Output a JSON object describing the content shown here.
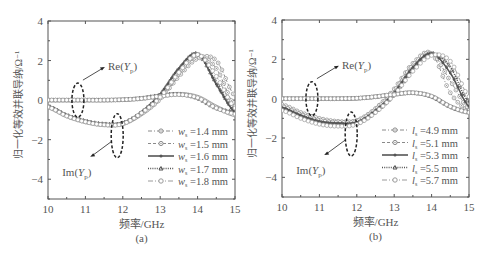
{
  "chart_data": [
    {
      "type": "line",
      "panel_label": "(a)",
      "xlabel": "频率/GHz",
      "ylabel": "归一化等效并联导纳/Ω⁻¹",
      "xlim": [
        10,
        15
      ],
      "ylim": [
        -5,
        4
      ],
      "xticks": [
        10,
        11,
        12,
        13,
        14,
        15
      ],
      "yticks": [
        4,
        2,
        0,
        -2,
        -4
      ],
      "grid": false,
      "legend_position": "lower right",
      "annotations": [
        "Re(Yp)",
        "Im(Yp)"
      ],
      "x": [
        10,
        10.5,
        11,
        11.5,
        12,
        12.5,
        13,
        13.5,
        14,
        14.5,
        15
      ],
      "series": [
        {
          "name": "ws=1.4 mm",
          "style": "dash-dot circle-dot",
          "re": [
            0.0,
            0.0,
            0.0,
            0.0,
            0.02,
            0.08,
            0.2,
            0.3,
            0.15,
            -0.35,
            -0.75
          ],
          "im": [
            -0.35,
            -0.8,
            -1.1,
            -1.25,
            -1.2,
            -0.7,
            0.1,
            1.3,
            2.2,
            1.6,
            -0.3
          ]
        },
        {
          "name": "ws=1.5 mm",
          "style": "dashed circle-dot",
          "re": [
            0.0,
            0.0,
            0.0,
            0.0,
            0.02,
            0.08,
            0.2,
            0.3,
            0.15,
            -0.35,
            -0.75
          ],
          "im": [
            -0.35,
            -0.8,
            -1.1,
            -1.25,
            -1.2,
            -0.7,
            0.05,
            1.2,
            2.1,
            2.0,
            0.2
          ]
        },
        {
          "name": "ws=1.6 mm",
          "style": "solid filled-dot",
          "re": [
            0.0,
            0.0,
            0.0,
            0.0,
            0.02,
            0.1,
            0.25,
            0.3,
            0.1,
            -0.4,
            -0.6
          ],
          "im": [
            -0.3,
            -0.75,
            -1.05,
            -1.2,
            -1.15,
            -0.6,
            0.3,
            1.6,
            2.35,
            0.8,
            -0.6
          ]
        },
        {
          "name": "ws=1.7 mm",
          "style": "dotted triangle",
          "re": [
            0.0,
            0.0,
            0.0,
            0.0,
            0.02,
            0.1,
            0.25,
            0.3,
            0.1,
            -0.4,
            -0.6
          ],
          "im": [
            -0.3,
            -0.75,
            -1.05,
            -1.2,
            -1.15,
            -0.6,
            0.3,
            1.6,
            2.35,
            0.9,
            -0.5
          ]
        },
        {
          "name": "ws=1.8 mm",
          "style": "dash-dot open-circle",
          "re": [
            0.0,
            0.0,
            0.0,
            0.0,
            0.02,
            0.08,
            0.2,
            0.28,
            0.12,
            -0.4,
            -0.7
          ],
          "im": [
            -0.35,
            -0.8,
            -1.1,
            -1.25,
            -1.2,
            -0.65,
            0.15,
            1.4,
            2.3,
            1.2,
            -0.4
          ]
        }
      ]
    },
    {
      "type": "line",
      "panel_label": "(b)",
      "xlabel": "频率/GHz",
      "ylabel": "归一化等效并联导纳/Ω⁻¹",
      "xlim": [
        10,
        15
      ],
      "ylim": [
        -5,
        4
      ],
      "xticks": [
        10,
        11,
        12,
        13,
        14,
        15
      ],
      "yticks": [
        4,
        2,
        0,
        -2,
        -4
      ],
      "grid": false,
      "legend_position": "lower right",
      "annotations": [
        "Re(Yp)",
        "Im(Yp)"
      ],
      "x": [
        10,
        10.5,
        11,
        11.5,
        12,
        12.5,
        13,
        13.5,
        14,
        14.5,
        15
      ],
      "series": [
        {
          "name": "ls=4.9 mm",
          "style": "dash-dot circle-dot",
          "re": [
            0.0,
            0.0,
            0.0,
            0.0,
            0.02,
            0.1,
            0.22,
            0.3,
            0.12,
            -0.4,
            -0.7
          ],
          "im": [
            -0.3,
            -0.7,
            -1.0,
            -1.15,
            -1.1,
            -0.5,
            0.5,
            1.8,
            2.3,
            0.3,
            -0.6
          ]
        },
        {
          "name": "ls=5.1 mm",
          "style": "dashed circle-dot",
          "re": [
            0.0,
            0.0,
            0.0,
            0.0,
            0.02,
            0.1,
            0.22,
            0.3,
            0.12,
            -0.4,
            -0.7
          ],
          "im": [
            -0.4,
            -0.8,
            -1.1,
            -1.2,
            -1.15,
            -0.55,
            0.4,
            1.7,
            2.3,
            0.9,
            -0.5
          ]
        },
        {
          "name": "ls=5.3 mm",
          "style": "solid filled-dot",
          "re": [
            0.0,
            0.0,
            0.0,
            0.0,
            0.02,
            0.1,
            0.22,
            0.3,
            0.12,
            -0.4,
            -0.7
          ],
          "im": [
            -0.45,
            -0.85,
            -1.15,
            -1.25,
            -1.2,
            -0.6,
            0.3,
            1.6,
            2.3,
            1.3,
            -0.4
          ]
        },
        {
          "name": "ls=5.5 mm",
          "style": "dotted triangle",
          "re": [
            0.0,
            0.0,
            0.0,
            0.0,
            0.02,
            0.1,
            0.22,
            0.3,
            0.12,
            -0.4,
            -0.7
          ],
          "im": [
            -0.5,
            -0.9,
            -1.2,
            -1.3,
            -1.25,
            -0.65,
            0.25,
            1.5,
            2.3,
            1.6,
            -0.2
          ]
        },
        {
          "name": "ls=5.7 mm",
          "style": "dash-dot open-circle",
          "re": [
            0.0,
            0.0,
            0.0,
            0.0,
            0.02,
            0.1,
            0.22,
            0.3,
            0.12,
            -0.4,
            -0.7
          ],
          "im": [
            -0.6,
            -1.0,
            -1.3,
            -1.4,
            -1.3,
            -0.7,
            0.2,
            1.4,
            2.2,
            1.9,
            0.1
          ]
        }
      ]
    }
  ],
  "panels": [
    {
      "caption": "(a)",
      "xlabel": "频率/GHz",
      "ylabel": "归一化等效并联导纳/Ω⁻¹",
      "re_label": "Re(Yp)",
      "im_label": "Im(Yp)",
      "legend": [
        {
          "sym": "w",
          "sub": "s",
          "value": "=1.4 mm"
        },
        {
          "sym": "w",
          "sub": "s",
          "value": "=1.5 mm"
        },
        {
          "sym": "w",
          "sub": "s",
          "value": "=1.6 mm"
        },
        {
          "sym": "w",
          "sub": "s",
          "value": "=1.7 mm"
        },
        {
          "sym": "w",
          "sub": "s",
          "value": "=1.8 mm"
        }
      ]
    },
    {
      "caption": "(b)",
      "xlabel": "频率/GHz",
      "ylabel": "归一化等效并联导纳/Ω⁻¹",
      "re_label": "Re(Yp)",
      "im_label": "Im(Yp)",
      "legend": [
        {
          "sym": "l",
          "sub": "s",
          "value": "=4.9 mm"
        },
        {
          "sym": "l",
          "sub": "s",
          "value": "=5.1 mm"
        },
        {
          "sym": "l",
          "sub": "s",
          "value": "=5.3 mm"
        },
        {
          "sym": "l",
          "sub": "s",
          "value": "=5.5 mm"
        },
        {
          "sym": "l",
          "sub": "s",
          "value": "=5.7 mm"
        }
      ]
    }
  ],
  "colors": {
    "axis": "#555555",
    "curve_dark": "#6a6a6a",
    "curve_light": "#9a9a9a",
    "annotation": "#222222"
  }
}
